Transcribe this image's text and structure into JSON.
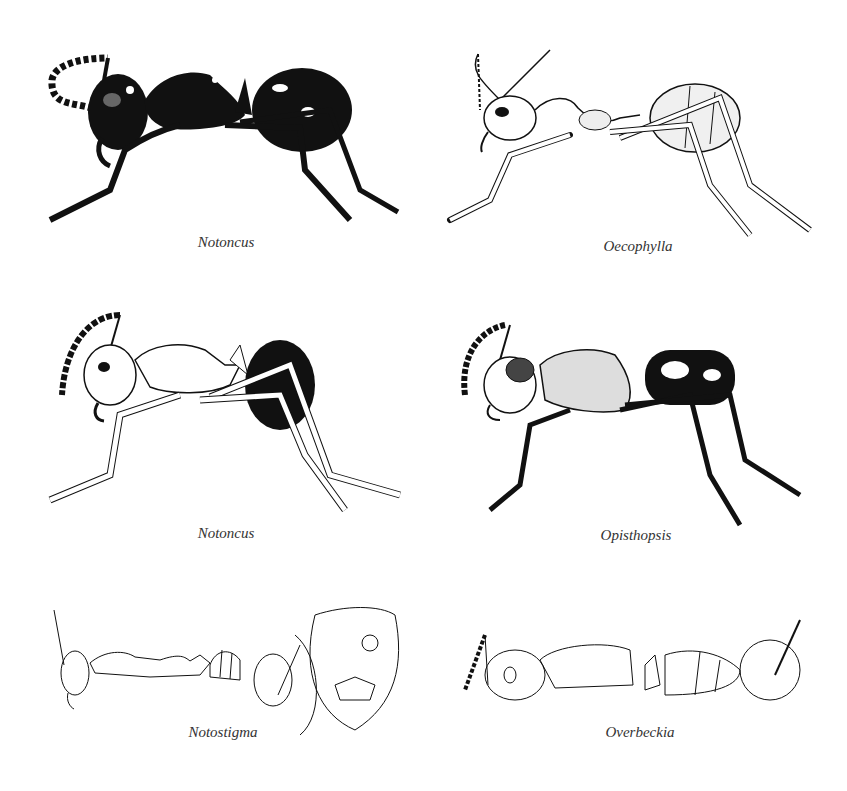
{
  "plate": {
    "figures": [
      {
        "id": "fig-1",
        "genus": "Notoncus",
        "style": "dark stippled habitus, lateral view"
      },
      {
        "id": "fig-2",
        "genus": "Oecophylla",
        "style": "pale stippled habitus, lateral view"
      },
      {
        "id": "fig-3",
        "genus": "Notoncus",
        "style": "pale body with dark gaster, lateral view"
      },
      {
        "id": "fig-4",
        "genus": "Opisthopsis",
        "style": "hatched body with dark spotted gaster, lateral view"
      },
      {
        "id": "fig-5",
        "genus": "Notostigma",
        "style": "line drawings: lateral body, full-face head, enlarged head"
      },
      {
        "id": "fig-6",
        "genus": "Overbeckia",
        "style": "line drawings: lateral body, full-face head"
      }
    ]
  },
  "colors": {
    "ink": "#111111",
    "paper": "#ffffff",
    "caption": "#333333"
  }
}
